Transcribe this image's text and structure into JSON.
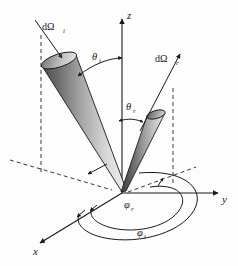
{
  "figure": {
    "background_color": "#fdfdfd",
    "ink_color": "#1a1a1a"
  },
  "axes": {
    "x_label": "x",
    "y_label": "y",
    "z_label": "z"
  },
  "labels": {
    "incident_solid_angle": "dΩ",
    "incident_solid_angle_sub": "i",
    "reflected_solid_angle": "dΩ",
    "reflected_solid_angle_sub": "r",
    "theta_incident": "θ",
    "theta_incident_sub": "i",
    "theta_reflected": "θ",
    "theta_reflected_sub": "r",
    "phi_reflected": "φ",
    "phi_reflected_sub": "r",
    "phi_incident": "φ",
    "phi_incident_sub": "i"
  },
  "geometry": {
    "origin_x": 122,
    "origin_y": 193,
    "z_tip_x": 122,
    "z_tip_y": 16,
    "y_tip_x": 222,
    "y_tip_y": 193,
    "x_tip_x": 36,
    "x_tip_y": 246
  },
  "cones": {
    "incident": {
      "gradient_dark": "#4a4a4a",
      "gradient_light": "#ededed",
      "cap_dark": "#6d6d6d",
      "cap_light": "#d8d8d8"
    },
    "reflected": {
      "gradient_dark": "#3d3d3d",
      "gradient_light": "#e2e2e2",
      "cap_dark": "#555555",
      "cap_light": "#cfcfcf"
    }
  }
}
